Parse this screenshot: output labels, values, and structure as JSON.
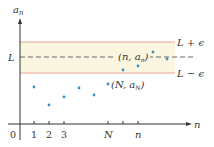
{
  "diagram": {
    "y_axis_label": "a",
    "y_axis_sub": "n",
    "x_axis_label": "n",
    "origin_label": "0",
    "limit_label": "L",
    "upper_band_label": "L + ϵ",
    "lower_band_label": "L − ϵ",
    "x_ticks": [
      "1",
      "2",
      "3",
      "N",
      "n"
    ],
    "point_label_n": "(n, a",
    "point_label_n_sub": "n",
    "point_label_N": "(N, a",
    "point_label_N_sub": "N",
    "colors": {
      "band_fill": "#fbf6e0",
      "band_edge": "#e8a59a",
      "dots": "#3a8fc9",
      "axes": "#333333",
      "dash": "#666666"
    },
    "points": [
      {
        "x": 34,
        "y": 87
      },
      {
        "x": 49,
        "y": 105
      },
      {
        "x": 64,
        "y": 97
      },
      {
        "x": 79,
        "y": 88
      },
      {
        "x": 94,
        "y": 95
      },
      {
        "x": 108,
        "y": 84
      },
      {
        "x": 123,
        "y": 70
      },
      {
        "x": 138,
        "y": 66
      },
      {
        "x": 153,
        "y": 52
      },
      {
        "x": 167,
        "y": 59
      }
    ]
  }
}
